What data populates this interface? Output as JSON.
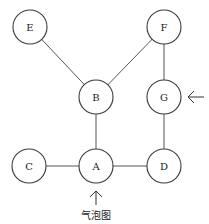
{
  "diagram": {
    "type": "graph",
    "nodes": [
      {
        "id": "E",
        "label": "E",
        "x": 30,
        "y": 27
      },
      {
        "id": "F",
        "label": "F",
        "x": 164,
        "y": 27
      },
      {
        "id": "B",
        "label": "B",
        "x": 96,
        "y": 97
      },
      {
        "id": "G",
        "label": "G",
        "x": 164,
        "y": 97
      },
      {
        "id": "C",
        "label": "C",
        "x": 29,
        "y": 166
      },
      {
        "id": "A",
        "label": "A",
        "x": 96,
        "y": 166
      },
      {
        "id": "D",
        "label": "D",
        "x": 164,
        "y": 166
      }
    ],
    "edges": [
      [
        "E",
        "B"
      ],
      [
        "F",
        "B"
      ],
      [
        "F",
        "G"
      ],
      [
        "B",
        "A"
      ],
      [
        "C",
        "A"
      ],
      [
        "A",
        "D"
      ],
      [
        "G",
        "D"
      ]
    ],
    "annotations": [
      {
        "type": "arrow",
        "target": "G",
        "direction": "left"
      },
      {
        "type": "arrow",
        "target": "A",
        "direction": "up",
        "caption": "气泡图"
      }
    ],
    "caption": "气泡图"
  }
}
